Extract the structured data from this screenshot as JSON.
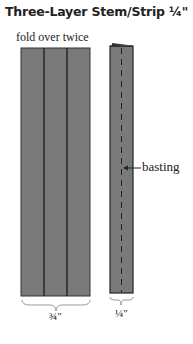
{
  "title": "Three-Layer Stem/Strip ¼\"",
  "subtitle": "fold over twice",
  "labels": {
    "basting": "basting",
    "left_width": "¾\"",
    "right_width": "¼\""
  },
  "colors": {
    "fabric": "#777777",
    "line": "#222222"
  }
}
